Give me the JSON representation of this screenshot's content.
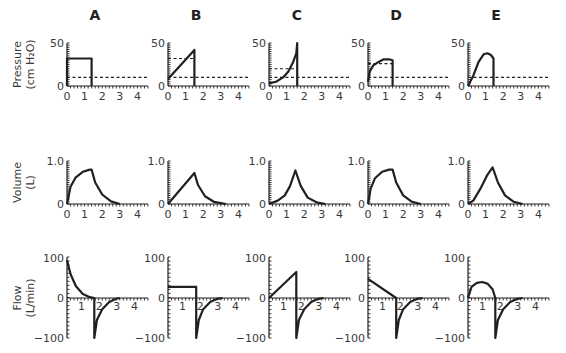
{
  "figure": {
    "columns": [
      "A",
      "B",
      "C",
      "D",
      "E"
    ],
    "rows": [
      {
        "key": "pressure",
        "label_lines": [
          "Pressure",
          "(cm H₂O)"
        ],
        "y_ticks": [
          "0",
          "50"
        ]
      },
      {
        "key": "volume",
        "label_lines": [
          "Volume",
          "(L)"
        ],
        "y_ticks": [
          "0",
          "1.0"
        ]
      },
      {
        "key": "flow",
        "label_lines": [
          "Flow",
          "(L/min)"
        ],
        "y_ticks": [
          "−100",
          "0",
          "100"
        ]
      }
    ],
    "x_ticks": [
      "0",
      "1",
      "2",
      "3",
      "4"
    ],
    "flow_x_ticks": [
      "1",
      "2",
      "3",
      "4"
    ]
  },
  "chart_data": [
    {
      "type": "line",
      "panel": "A-pressure",
      "title": "A",
      "ylabel": "Pressure (cm H2O)",
      "xlabel": "",
      "xlim": [
        0,
        4.6
      ],
      "ylim": [
        0,
        50
      ],
      "series": [
        {
          "name": "airway pressure",
          "x": [
            0,
            0,
            1.4,
            1.4
          ],
          "y": [
            0,
            32,
            32,
            0
          ]
        },
        {
          "name": "reference (dashed)",
          "style": "dashed",
          "x": [
            0,
            4.6
          ],
          "y": [
            10,
            10
          ]
        }
      ]
    },
    {
      "type": "line",
      "panel": "B-pressure",
      "title": "B",
      "xlim": [
        0,
        4.6
      ],
      "ylim": [
        0,
        50
      ],
      "series": [
        {
          "name": "airway pressure",
          "x": [
            0,
            1.5,
            1.5
          ],
          "y": [
            8,
            42,
            0
          ]
        },
        {
          "name": "plateau (dashed)",
          "style": "dashed",
          "x": [
            0,
            1.5
          ],
          "y": [
            32,
            32
          ]
        },
        {
          "name": "reference (dashed)",
          "style": "dashed",
          "x": [
            0,
            4.6
          ],
          "y": [
            10,
            10
          ]
        }
      ]
    },
    {
      "type": "line",
      "panel": "C-pressure",
      "title": "C",
      "xlim": [
        0,
        4.6
      ],
      "ylim": [
        0,
        50
      ],
      "series": [
        {
          "name": "airway pressure",
          "x": [
            0,
            0.4,
            0.8,
            1.1,
            1.35,
            1.55,
            1.6,
            1.6
          ],
          "y": [
            3,
            5,
            10,
            17,
            27,
            38,
            50,
            0
          ]
        },
        {
          "name": "plateau (dashed)",
          "style": "dashed",
          "x": [
            0,
            1.6
          ],
          "y": [
            20,
            20
          ]
        },
        {
          "name": "reference (dashed)",
          "style": "dashed",
          "x": [
            0,
            4.6
          ],
          "y": [
            10,
            10
          ]
        }
      ]
    },
    {
      "type": "line",
      "panel": "D-pressure",
      "title": "D",
      "xlim": [
        0,
        4.6
      ],
      "ylim": [
        0,
        50
      ],
      "series": [
        {
          "name": "airway pressure",
          "x": [
            0,
            0.1,
            0.3,
            0.6,
            0.9,
            1.2,
            1.4,
            1.4
          ],
          "y": [
            5,
            17,
            24,
            28,
            31,
            31,
            30,
            0
          ]
        },
        {
          "name": "plateau (dashed)",
          "style": "dashed",
          "x": [
            0,
            1.4
          ],
          "y": [
            26,
            26
          ]
        },
        {
          "name": "reference (dashed)",
          "style": "dashed",
          "x": [
            0,
            4.6
          ],
          "y": [
            10,
            10
          ]
        }
      ]
    },
    {
      "type": "line",
      "panel": "E-pressure",
      "title": "E",
      "xlim": [
        0,
        4.6
      ],
      "ylim": [
        0,
        50
      ],
      "series": [
        {
          "name": "airway pressure",
          "x": [
            0,
            0.3,
            0.6,
            0.9,
            1.1,
            1.3,
            1.45,
            1.45
          ],
          "y": [
            0,
            12,
            28,
            37,
            38,
            36,
            32,
            0
          ]
        },
        {
          "name": "reference (dashed)",
          "style": "dashed",
          "x": [
            0,
            4.6
          ],
          "y": [
            10,
            10
          ]
        }
      ]
    },
    {
      "type": "line",
      "panel": "A-volume",
      "ylabel": "Volume (L)",
      "xlim": [
        0,
        4.6
      ],
      "ylim": [
        0,
        1.0
      ],
      "series": [
        {
          "name": "volume",
          "x": [
            0,
            0.2,
            0.5,
            0.9,
            1.3,
            1.4,
            1.6,
            2.0,
            2.5,
            3.0
          ],
          "y": [
            0,
            0.4,
            0.62,
            0.75,
            0.8,
            0.8,
            0.5,
            0.22,
            0.06,
            0
          ]
        }
      ]
    },
    {
      "type": "line",
      "panel": "B-volume",
      "xlim": [
        0,
        4.6
      ],
      "ylim": [
        0,
        1.0
      ],
      "series": [
        {
          "name": "volume",
          "x": [
            0,
            1.5,
            1.7,
            2.1,
            2.6,
            3.3
          ],
          "y": [
            0,
            0.72,
            0.45,
            0.18,
            0.05,
            0
          ]
        }
      ]
    },
    {
      "type": "line",
      "panel": "C-volume",
      "xlim": [
        0,
        4.6
      ],
      "ylim": [
        0,
        1.0
      ],
      "series": [
        {
          "name": "volume",
          "x": [
            0,
            0.5,
            0.9,
            1.2,
            1.5,
            1.8,
            2.2,
            2.7,
            3.2
          ],
          "y": [
            0,
            0.08,
            0.2,
            0.42,
            0.78,
            0.42,
            0.15,
            0.04,
            0
          ]
        }
      ]
    },
    {
      "type": "line",
      "panel": "D-volume",
      "xlim": [
        0,
        4.6
      ],
      "ylim": [
        0,
        1.0
      ],
      "series": [
        {
          "name": "volume",
          "x": [
            0,
            0.15,
            0.4,
            0.8,
            1.2,
            1.4,
            1.6,
            2.0,
            2.5,
            3.0
          ],
          "y": [
            0,
            0.35,
            0.6,
            0.75,
            0.8,
            0.8,
            0.5,
            0.2,
            0.05,
            0
          ]
        }
      ]
    },
    {
      "type": "line",
      "panel": "E-volume",
      "xlim": [
        0,
        4.6
      ],
      "ylim": [
        0,
        1.0
      ],
      "series": [
        {
          "name": "volume",
          "x": [
            0,
            0.3,
            0.7,
            1.1,
            1.4,
            1.7,
            2.1,
            2.6,
            3.1
          ],
          "y": [
            0,
            0.08,
            0.35,
            0.68,
            0.85,
            0.5,
            0.2,
            0.05,
            0
          ]
        }
      ]
    },
    {
      "type": "line",
      "panel": "A-flow",
      "ylabel": "Flow (L/min)",
      "xlim": [
        0,
        4.6
      ],
      "ylim": [
        -100,
        100
      ],
      "series": [
        {
          "name": "flow",
          "x": [
            0,
            0.2,
            0.5,
            0.9,
            1.3,
            1.55,
            1.55,
            1.7,
            2.0,
            2.4,
            2.8,
            3.0
          ],
          "y": [
            95,
            60,
            30,
            10,
            2,
            0,
            -100,
            -55,
            -28,
            -10,
            -2,
            0
          ]
        }
      ]
    },
    {
      "type": "line",
      "panel": "B-flow",
      "xlim": [
        0,
        4.6
      ],
      "ylim": [
        -100,
        100
      ],
      "series": [
        {
          "name": "flow",
          "x": [
            0,
            1.6,
            1.6,
            1.75,
            2.0,
            2.4,
            2.8,
            3.1
          ],
          "y": [
            28,
            28,
            -100,
            -55,
            -28,
            -10,
            -2,
            0
          ]
        }
      ]
    },
    {
      "type": "line",
      "panel": "C-flow",
      "xlim": [
        0,
        4.6
      ],
      "ylim": [
        -100,
        100
      ],
      "series": [
        {
          "name": "flow",
          "x": [
            0,
            1.55,
            1.55,
            1.7,
            2.0,
            2.4,
            2.8,
            3.1
          ],
          "y": [
            0,
            65,
            -100,
            -55,
            -28,
            -10,
            -2,
            0
          ]
        }
      ]
    },
    {
      "type": "line",
      "panel": "D-flow",
      "xlim": [
        0,
        4.6
      ],
      "ylim": [
        -100,
        100
      ],
      "series": [
        {
          "name": "flow",
          "x": [
            0,
            1.6,
            1.6,
            1.75,
            2.0,
            2.4,
            2.8,
            3.1
          ],
          "y": [
            48,
            0,
            -100,
            -55,
            -28,
            -10,
            -2,
            0
          ]
        }
      ]
    },
    {
      "type": "line",
      "panel": "E-flow",
      "xlim": [
        0,
        4.6
      ],
      "ylim": [
        -100,
        100
      ],
      "series": [
        {
          "name": "flow",
          "x": [
            0,
            0.2,
            0.5,
            0.8,
            1.1,
            1.4,
            1.55,
            1.55,
            1.7,
            2.0,
            2.4,
            2.8,
            3.1
          ],
          "y": [
            0,
            28,
            38,
            40,
            36,
            22,
            0,
            -100,
            -55,
            -28,
            -10,
            -2,
            0
          ]
        }
      ]
    }
  ]
}
